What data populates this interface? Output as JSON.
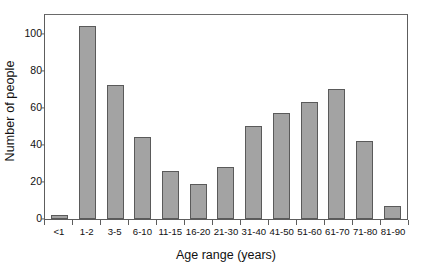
{
  "chart_data": {
    "type": "bar",
    "title": "",
    "subtitle": "",
    "xlabel": "Age range (years)",
    "ylabel": "Number of people",
    "categories": [
      "<1",
      "1-2",
      "3-5",
      "6-10",
      "11-15",
      "16-20",
      "21-30",
      "31-40",
      "41-50",
      "51-60",
      "61-70",
      "71-80",
      "81-90"
    ],
    "values": [
      2,
      104,
      72,
      44,
      26,
      19,
      28,
      50,
      57,
      63,
      70,
      42,
      7
    ],
    "series": [
      {
        "name": "Number of people",
        "values": [
          2,
          104,
          72,
          44,
          26,
          19,
          28,
          50,
          57,
          63,
          70,
          42,
          7
        ]
      }
    ],
    "ylim": [
      0,
      110
    ],
    "yticks": [
      0,
      20,
      40,
      60,
      80,
      100
    ],
    "ytick_labels": [
      "0",
      "20",
      "40",
      "60",
      "80",
      "100"
    ],
    "grid": false,
    "legend": false,
    "legend_position": "none",
    "bar_fill_color": "#a3a3a3",
    "bar_edge_color": "#5a5a5a",
    "axis_color": "#5d5d5d",
    "background_color": "#ffffff"
  }
}
